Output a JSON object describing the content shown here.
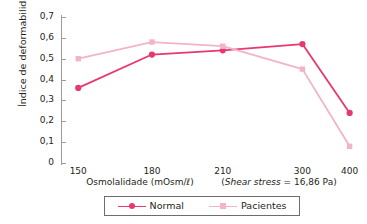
{
  "chart_data": {
    "type": "line",
    "title": "",
    "xlabel": "Osmolalidade (mOsm/ℓ)",
    "xnote": "(Shear stress = 16,86 Pa)",
    "xnote_italic": "Shear stress",
    "xnote_rest": " = 16,86 Pa)",
    "ylabel": "Índice de deformabilidade",
    "categories": [
      "150",
      "180",
      "210",
      "300",
      "400"
    ],
    "x": [
      150,
      180,
      210,
      300,
      400
    ],
    "ylim": [
      0,
      0.7
    ],
    "ytick_labels": [
      "0",
      "0,1",
      "0,2",
      "0,3",
      "0,4",
      "0,5",
      "0,6",
      "0,7"
    ],
    "ytick_values": [
      0,
      0.1,
      0.2,
      0.3,
      0.4,
      0.5,
      0.6,
      0.7
    ],
    "grid": false,
    "legend_position": "bottom",
    "series": [
      {
        "name": "Normal",
        "color": "#E8386E",
        "marker": "circle",
        "values": [
          0.36,
          0.52,
          0.54,
          0.57,
          0.24
        ]
      },
      {
        "name": "Pacientes",
        "color": "#F2B4C6",
        "marker": "square",
        "values": [
          0.5,
          0.58,
          0.56,
          0.45,
          0.08
        ]
      }
    ]
  },
  "legend": {
    "entries": [
      {
        "label": "Normal"
      },
      {
        "label": "Pacientes"
      }
    ]
  }
}
